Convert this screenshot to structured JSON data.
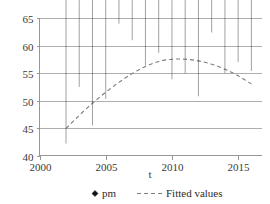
{
  "chart_data": {
    "type": "scatter",
    "title": "",
    "xlabel": "t",
    "ylabel": "",
    "xlim": [
      2000,
      2016.8
    ],
    "ylim": [
      40,
      65
    ],
    "grid": true,
    "legend_position": "bottom",
    "x_ticks": [
      2000,
      2005,
      2010,
      2015
    ],
    "x_tick_labels": [
      "2000",
      "2005",
      "2010",
      "2015"
    ],
    "y_ticks": [
      40,
      45,
      50,
      55,
      60,
      65
    ],
    "y_tick_labels": [
      "40",
      "45",
      "50",
      "55",
      "60",
      "65"
    ],
    "series": [
      {
        "name": "pm",
        "type": "scatter",
        "marker": "diamond",
        "color": "#131313",
        "x": [
          2002,
          2003,
          2004,
          2005,
          2006,
          2007,
          2008,
          2009,
          2010,
          2011,
          2012,
          2013,
          2014,
          2015,
          2016
        ],
        "values": [
          41.6,
          51.9,
          44.9,
          49.7,
          63.4,
          60.4,
          55.8,
          58.1,
          53.3,
          54.4,
          50.2,
          61.8,
          54.4,
          56.4,
          54.8
        ]
      },
      {
        "name": "Fitted values",
        "type": "line",
        "style": "dashed",
        "color": "#7d7d7d",
        "x": [
          2002,
          2003,
          2004,
          2005,
          2006,
          2007,
          2008,
          2009,
          2010,
          2011,
          2012,
          2013,
          2014,
          2015,
          2016
        ],
        "values": [
          44.9,
          47.3,
          49.5,
          51.5,
          53.3,
          54.9,
          56.2,
          57.1,
          57.5,
          57.5,
          57.2,
          56.6,
          55.7,
          54.5,
          53.0
        ]
      }
    ]
  },
  "legend": {
    "entries": [
      {
        "label": "pm",
        "marker": "diamond"
      },
      {
        "label": "Fitted values",
        "marker": "dashed-line"
      }
    ]
  },
  "axis": {
    "x_title": "t"
  }
}
